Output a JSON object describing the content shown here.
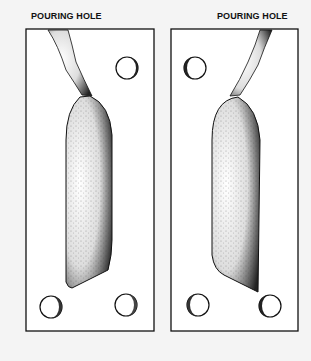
{
  "diagram": {
    "labels": {
      "left": "POURING HOLE",
      "right": "POURING HOLE"
    },
    "panels": [
      {
        "name": "left-mold-half",
        "holes": 3,
        "cavity": "cavity-mirrored-left"
      },
      {
        "name": "right-mold-half",
        "holes": 3,
        "cavity": "cavity-mirrored-right"
      }
    ],
    "colors": {
      "background": "#f4f4f4",
      "panel": "#ffffff",
      "ink": "#111111"
    }
  }
}
